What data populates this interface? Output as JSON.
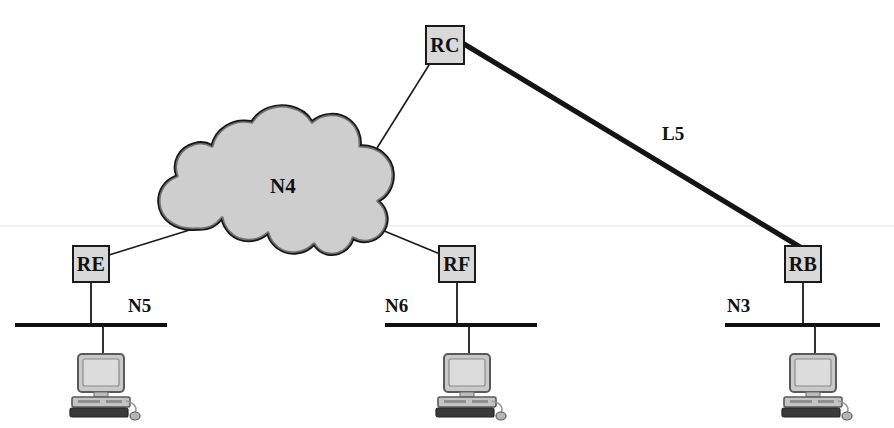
{
  "diagram": {
    "background_color": "#ffffff",
    "line_color": "#1a1a1a",
    "node_fill_color": "#d9d9d9",
    "cloud_fill_color": "#e2e2e2"
  },
  "cloud": {
    "label": "N4",
    "name": "network-cloud-n4",
    "center_x": 292,
    "center_y": 186
  },
  "routers": [
    {
      "id": "rc",
      "label": "RC",
      "x": 425,
      "y": 25,
      "w": 40,
      "h": 40
    },
    {
      "id": "re",
      "label": "RE",
      "x": 72,
      "y": 245,
      "w": 38,
      "h": 38
    },
    {
      "id": "rf",
      "label": "RF",
      "x": 438,
      "y": 245,
      "w": 38,
      "h": 38
    },
    {
      "id": "rb",
      "label": "RB",
      "x": 784,
      "y": 245,
      "w": 38,
      "h": 38
    }
  ],
  "networks": [
    {
      "id": "n5",
      "label": "N5",
      "label_x": 128,
      "label_y": 296,
      "bus_x1": 15,
      "bus_x2": 167,
      "bus_y": 325,
      "drop_x": 91
    },
    {
      "id": "n6",
      "label": "N6",
      "label_x": 385,
      "label_y": 296,
      "bus_x1": 385,
      "bus_x2": 537,
      "bus_y": 325,
      "drop_x": 457
    },
    {
      "id": "n3",
      "label": "N3",
      "label_x": 727,
      "label_y": 296,
      "bus_x1": 725,
      "bus_x2": 880,
      "bus_y": 325,
      "drop_x": 803
    }
  ],
  "links": [
    {
      "id": "rc-n4",
      "label": "",
      "style": "thin",
      "from": "RC",
      "to": "N4"
    },
    {
      "id": "rc-rb",
      "label": "L5",
      "style": "thick",
      "from": "RC",
      "to": "RB",
      "label_x": 662,
      "label_y": 124
    },
    {
      "id": "n4-re",
      "label": "",
      "style": "thin",
      "from": "N4",
      "to": "RE"
    },
    {
      "id": "n4-rf",
      "label": "",
      "style": "thin",
      "from": "N4",
      "to": "RF"
    },
    {
      "id": "re-n5",
      "label": "",
      "style": "thin",
      "from": "RE",
      "to": "N5"
    },
    {
      "id": "rf-n6",
      "label": "",
      "style": "thin",
      "from": "RF",
      "to": "N6"
    },
    {
      "id": "rb-n3",
      "label": "",
      "style": "thin",
      "from": "RB",
      "to": "N3"
    }
  ],
  "workstations": [
    {
      "id": "ws-n5",
      "network": "N5",
      "x": 64,
      "y": 341,
      "drop_from_y": 325
    },
    {
      "id": "ws-n6",
      "network": "N6",
      "x": 430,
      "y": 341,
      "drop_from_y": 325
    },
    {
      "id": "ws-n3",
      "network": "N3",
      "x": 776,
      "y": 341,
      "drop_from_y": 325
    }
  ]
}
